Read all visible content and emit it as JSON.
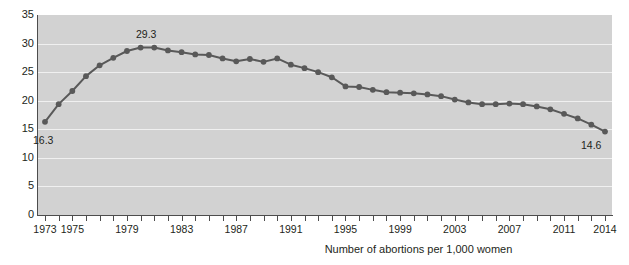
{
  "chart_data": {
    "type": "line",
    "title": "",
    "subtitle": "",
    "xlabel": "Number of abortions per 1,000 women",
    "ylabel": "",
    "ylim": [
      0,
      35
    ],
    "ytick_step": 5,
    "yticks": [
      "0",
      "5",
      "10",
      "15",
      "20",
      "25",
      "30",
      "35"
    ],
    "xlim": [
      1973,
      2014
    ],
    "xticks_labeled": [
      "1973",
      "1975",
      "1979",
      "1983",
      "1987",
      "1991",
      "1995",
      "1999",
      "2003",
      "2007",
      "2011",
      "2014"
    ],
    "grid": "horizontal",
    "legend": "none",
    "series": [
      {
        "name": "Number of abortions per 1,000 women",
        "color": "#595959",
        "marker": "circle",
        "x": [
          1973,
          1974,
          1975,
          1976,
          1977,
          1978,
          1979,
          1980,
          1981,
          1982,
          1983,
          1984,
          1985,
          1986,
          1987,
          1988,
          1989,
          1990,
          1991,
          1992,
          1993,
          1994,
          1995,
          1996,
          1997,
          1998,
          1999,
          2000,
          2001,
          2002,
          2003,
          2004,
          2005,
          2006,
          2007,
          2008,
          2009,
          2010,
          2011,
          2012,
          2013,
          2014
        ],
        "values": [
          16.3,
          19.4,
          21.7,
          24.3,
          26.2,
          27.5,
          28.7,
          29.3,
          29.3,
          28.8,
          28.5,
          28.1,
          28.0,
          27.4,
          26.9,
          27.3,
          26.8,
          27.4,
          26.3,
          25.7,
          25.0,
          24.1,
          22.5,
          22.4,
          21.9,
          21.5,
          21.4,
          21.3,
          21.1,
          20.8,
          20.2,
          19.7,
          19.4,
          19.4,
          19.5,
          19.4,
          19.0,
          18.5,
          17.7,
          16.9,
          15.8,
          14.6
        ],
        "point_labels": [
          {
            "x": 1973,
            "value": "16.3",
            "position": "below-right"
          },
          {
            "x": 1980,
            "value": "29.3",
            "position": "above"
          },
          {
            "x": 2014,
            "value": "14.6",
            "position": "below-left"
          }
        ]
      }
    ]
  },
  "labels": {
    "first_point": "16.3",
    "peak_point": "29.3",
    "last_point": "14.6",
    "caption": "Number of abortions per 1,000 women"
  }
}
